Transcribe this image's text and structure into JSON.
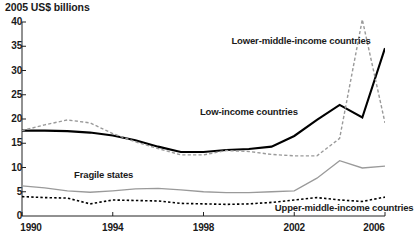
{
  "chart_data": {
    "type": "line",
    "title": "2005 US$ billions",
    "xlabel": "",
    "ylabel": "2005 US$ billions",
    "xlim": [
      1990,
      2006
    ],
    "ylim": [
      0,
      40
    ],
    "grid": false,
    "legend_position": "inline-annotations",
    "y_ticks": [
      40,
      35,
      30,
      25,
      20,
      15,
      10,
      5,
      0
    ],
    "x_ticks": [
      1990,
      1994,
      1998,
      2002,
      2006
    ],
    "x_minor_ticks": [
      1991,
      1992,
      1993,
      1995,
      1996,
      1997,
      1999,
      2000,
      2001,
      2003,
      2004,
      2005
    ],
    "x": [
      1990,
      1991,
      1992,
      1993,
      1994,
      1995,
      1996,
      1997,
      1998,
      1999,
      2000,
      2001,
      2002,
      2003,
      2004,
      2005,
      2006
    ],
    "series": [
      {
        "name": "Low-income countries",
        "style": "solid-black-thick",
        "color": "#000000",
        "label_x": 2000.0,
        "label_y": 21.5,
        "values": [
          17.6,
          17.6,
          17.5,
          17.2,
          16.6,
          15.6,
          14.3,
          13.2,
          13.2,
          13.6,
          13.8,
          14.3,
          16.5,
          19.8,
          22.9,
          20.3,
          34.6
        ]
      },
      {
        "name": "Lower-middle-income countries",
        "style": "dashed-gray",
        "color": "#9a9a9a",
        "label_x": 2002.3,
        "label_y": 36.0,
        "values": [
          17.6,
          18.8,
          19.8,
          19.2,
          17.0,
          15.3,
          13.9,
          12.6,
          12.6,
          13.5,
          13.3,
          12.7,
          12.4,
          12.4,
          16.0,
          40.5,
          19.2
        ]
      },
      {
        "name": "Fragile states",
        "style": "solid-gray",
        "color": "#9a9a9a",
        "label_x": 1993.6,
        "label_y": 8.4,
        "values": [
          6.2,
          5.8,
          5.2,
          4.9,
          5.2,
          5.6,
          5.7,
          5.4,
          5.0,
          4.8,
          4.8,
          5.0,
          5.2,
          7.8,
          11.4,
          9.9,
          10.3
        ]
      },
      {
        "name": "Upper-middle-income countries",
        "style": "dotted-black",
        "color": "#000000",
        "label_x": 2004.2,
        "label_y": 1.6,
        "values": [
          4.0,
          3.8,
          3.7,
          2.5,
          3.3,
          3.2,
          3.1,
          2.6,
          2.5,
          2.4,
          2.5,
          2.8,
          3.3,
          3.8,
          3.3,
          3.0,
          3.9
        ]
      }
    ]
  }
}
